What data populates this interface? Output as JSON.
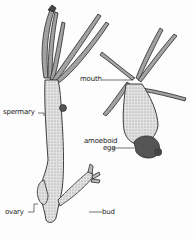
{
  "figure": {
    "labels": {
      "spermary": "spermary",
      "ovary": "ovary",
      "bud": "bud",
      "mouth": "mouth",
      "amoeboid_egg_line1": "amoeboid",
      "amoeboid_egg_line2": "egg"
    },
    "colors": {
      "ink": "#1a1a1a",
      "body_fill": "#d9d9d9",
      "tentacle_fill": "#bdbdbd",
      "background": "#fdfdfd"
    }
  }
}
